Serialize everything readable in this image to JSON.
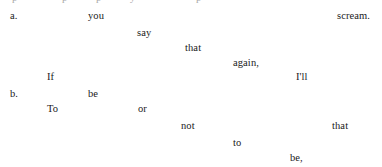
{
  "document": {
    "background_color": "#ffffff",
    "text_color": "#1a1a1a",
    "width": 382,
    "height": 167,
    "clipped_top_line": {
      "fragments": [
        "p",
        "p",
        "p",
        "y",
        "p"
      ]
    },
    "examples": [
      {
        "label": "a.",
        "label_x": 10,
        "label_y": 10,
        "words": [
          {
            "text": "you",
            "x": 88,
            "y": 10
          },
          {
            "text": "say",
            "x": 137,
            "y": 27
          },
          {
            "text": "that",
            "x": 185,
            "y": 42
          },
          {
            "text": "again,",
            "x": 233,
            "y": 57
          },
          {
            "text": "If",
            "x": 47,
            "y": 71
          },
          {
            "text": "I'll",
            "x": 296,
            "y": 71
          },
          {
            "text": "scream.",
            "x": 337,
            "y": 10
          }
        ]
      },
      {
        "label": "b.",
        "label_x": 10,
        "label_y": 88,
        "words": [
          {
            "text": "be",
            "x": 88,
            "y": 88
          },
          {
            "text": "To",
            "x": 47,
            "y": 103
          },
          {
            "text": "or",
            "x": 138,
            "y": 103
          },
          {
            "text": "not",
            "x": 181,
            "y": 120
          },
          {
            "text": "that",
            "x": 332,
            "y": 120
          },
          {
            "text": "to",
            "x": 233,
            "y": 137
          },
          {
            "text": "be,",
            "x": 290,
            "y": 152
          }
        ]
      }
    ]
  }
}
